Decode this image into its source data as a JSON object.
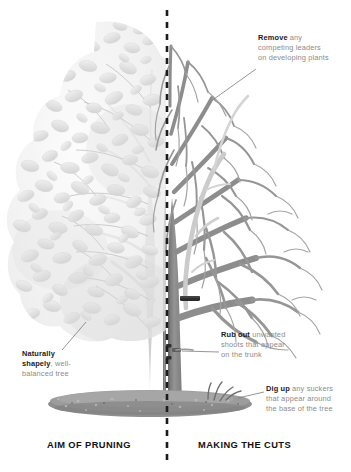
{
  "figure": {
    "title_left": "AIM OF PRUNING",
    "title_right": "MAKING THE CUTS",
    "divider": "dashed-vertical-line"
  },
  "callouts": {
    "remove": {
      "lead": "Remove",
      "line1_rest": " any",
      "line2": "competing leaders",
      "line3": "on developing plants"
    },
    "rub_out": {
      "lead": "Rub out",
      "line1_rest": " unwanted",
      "line2": "shoots that appear",
      "line3": "on the trunk"
    },
    "dig_up": {
      "lead": "Dig up",
      "line1_rest": " any suckers",
      "line2": "that appear around",
      "line3": "the base of the tree"
    },
    "naturally_shapely": {
      "line1": "Naturally",
      "lead": "shapely",
      "line2_rest": ", well-",
      "line3": "balanced tree"
    }
  },
  "colors": {
    "branch_dark": "#8a8a8a",
    "branch_light": "#c9c9c9",
    "foliage": "#e3e3e3",
    "cut_marker": "#2b2b2b",
    "text_body": "#8b8b8b",
    "text_lead": "#1a1a1a",
    "soil": "#9a9a9a",
    "background": "#ffffff"
  }
}
